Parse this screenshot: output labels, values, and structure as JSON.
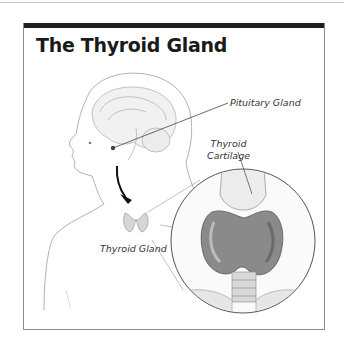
{
  "figure": {
    "title": "The Thyroid Gland",
    "labels": {
      "pituitary": "Pituitary Gland",
      "cartilage_line1": "Thyroid",
      "cartilage_line2": "Cartilage",
      "thyroid": "Thyroid Gland"
    },
    "colors": {
      "title_bar": "#1f1f1f",
      "frame_border": "#8a8a8a",
      "sketch": "#9a9a9a",
      "arrow": "#111111"
    }
  }
}
